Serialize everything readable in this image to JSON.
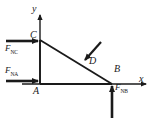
{
  "figure": {
    "colors": {
      "stroke": "#1a1a1a",
      "background": "#ffffff"
    },
    "axes": {
      "x_label": "x",
      "y_label": "y",
      "origin_label": "A"
    },
    "points": [
      {
        "id": "A",
        "label": "A",
        "x": 40,
        "y": 84
      },
      {
        "id": "B",
        "label": "B",
        "x": 112,
        "y": 84
      },
      {
        "id": "C",
        "label": "C",
        "x": 40,
        "y": 40
      },
      {
        "id": "D",
        "label": "D",
        "x": 84,
        "y": 62
      }
    ],
    "members": [
      {
        "name": "AC",
        "from": "A",
        "to": "C"
      },
      {
        "name": "AB",
        "from": "A",
        "to": "B"
      },
      {
        "name": "CB",
        "from": "C",
        "to": "B"
      }
    ],
    "forces": [
      {
        "id": "FNC",
        "symbol": "F",
        "subscript": "NC",
        "direction": "right",
        "applied_at": "C"
      },
      {
        "id": "FNA",
        "symbol": "F",
        "subscript": "NA",
        "direction": "right",
        "applied_at": "A"
      },
      {
        "id": "FNB",
        "symbol": "F",
        "subscript": "NB",
        "direction": "up",
        "applied_at": "B"
      },
      {
        "id": "FD",
        "symbol": "",
        "subscript": "",
        "direction": "down-left",
        "applied_at": "D"
      }
    ]
  }
}
